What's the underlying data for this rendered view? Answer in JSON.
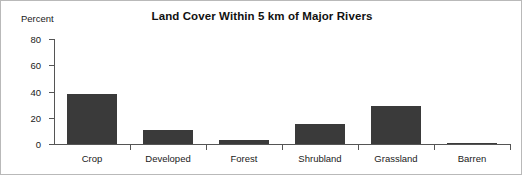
{
  "chart_data": {
    "type": "bar",
    "title": "Land Cover Within 5 km of Major Rivers",
    "xlabel": "",
    "ylabel": "Percent",
    "categories": [
      "Crop",
      "Developed",
      "Forest",
      "Shrubland",
      "Grassland",
      "Barren"
    ],
    "values": [
      38,
      11,
      3,
      15,
      29,
      1
    ],
    "ylim": [
      0,
      80
    ],
    "yticks": [
      0,
      20,
      40,
      60,
      80
    ],
    "ytick_labels": [
      "0",
      "20",
      "40",
      "60",
      "80"
    ],
    "grid": false,
    "legend": null,
    "bar_color": "#3a3a3a",
    "axis_color": "#555555",
    "background_color": "#ffffff",
    "border_color": "#b9b9b9"
  }
}
